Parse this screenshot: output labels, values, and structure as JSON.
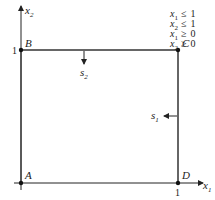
{
  "diagram": {
    "axes": {
      "x1": {
        "name": "x",
        "sub": "1"
      },
      "x2": {
        "name": "x",
        "sub": "2"
      }
    },
    "ticks": {
      "x1_one": "1",
      "x2_one": "1"
    },
    "vertices": {
      "A": "A",
      "B": "B",
      "C": "C",
      "D": "D"
    },
    "slacks": {
      "s1": {
        "name": "s",
        "sub": "1"
      },
      "s2": {
        "name": "s",
        "sub": "2"
      }
    },
    "constraints": [
      {
        "var": "x",
        "sub": "1",
        "op": "≤",
        "rhs": "1"
      },
      {
        "var": "x",
        "sub": "2",
        "op": "≤",
        "rhs": "1"
      },
      {
        "var": "x",
        "sub": "1",
        "op": "≥",
        "rhs": "0"
      },
      {
        "var": "x",
        "sub": "2",
        "op": "≥",
        "rhs": "0"
      }
    ],
    "colors": {
      "line": "#555555",
      "axis": "#222222",
      "point": "#111111"
    }
  }
}
